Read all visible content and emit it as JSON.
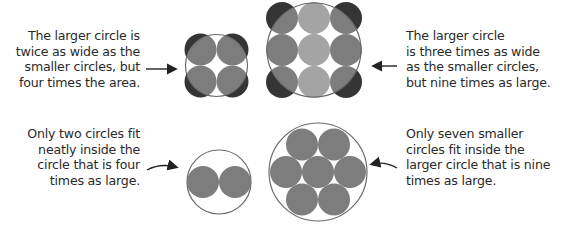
{
  "captions": {
    "top_left": [
      "The larger circle is",
      "twice as wide as the",
      "smaller circles, but",
      "four times the area."
    ],
    "top_right": [
      "The larger circle",
      "is three times as wide",
      "as the smaller circles,",
      "but nine times as large."
    ],
    "bottom_left": [
      "Only two circles fit",
      "neatly inside the",
      "circle that is four",
      "times as large."
    ],
    "bottom_right": [
      "Only seven smaller",
      "circles fit inside the",
      "larger circle that is nine",
      "times as large."
    ]
  },
  "colors": {
    "dark": "#353535",
    "medium": "#7d7d7d",
    "light": "#a4a4a4",
    "outline": "#6a6a6a"
  },
  "figures": {
    "two_by_two": {
      "label": "2x2 small circles in circle twice as wide"
    },
    "three_by_three": {
      "label": "3x3 small circles in circle three times as wide"
    },
    "two_packed": {
      "label": "2 circles packed in 4x area circle"
    },
    "seven_packed": {
      "label": "7 circles packed in 9x area circle"
    }
  }
}
